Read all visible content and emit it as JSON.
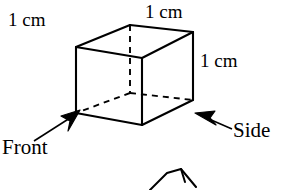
{
  "figure": {
    "background_color": "#ffffff",
    "stroke_color": "#000000",
    "labels": {
      "edge_top_left": "1 cm",
      "edge_top_right": "1 cm",
      "edge_vertical_right": "1 cm",
      "view_front": "Front",
      "view_side": "Side"
    },
    "geometry": {
      "shape": "cube",
      "visible_vertices": {
        "top_left": [
          76,
          47
        ],
        "top_back": [
          130,
          25
        ],
        "top_right": [
          193,
          32
        ],
        "top_front": [
          142,
          58
        ],
        "bottom_left": [
          76,
          113
        ],
        "bottom_front": [
          142,
          125
        ],
        "bottom_right": [
          193,
          100
        ]
      },
      "hidden_vertex": [
        130,
        93
      ],
      "hidden_edges": [
        [
          [
            130,
            25
          ],
          [
            130,
            93
          ]
        ],
        [
          [
            130,
            93
          ],
          [
            76,
            113
          ]
        ],
        [
          [
            130,
            93
          ],
          [
            193,
            100
          ]
        ]
      ]
    },
    "arrows": {
      "front_arrow": {
        "from": [
          32,
          140
        ],
        "to": [
          78,
          112
        ],
        "direction": "up-right"
      },
      "side_arrow": {
        "from": [
          232,
          128
        ],
        "to": [
          196,
          113
        ],
        "direction": "up-left"
      }
    },
    "partial_figure_below": {
      "description": "cropped second cube figure at bottom edge",
      "points": [
        [
          148,
          190
        ],
        [
          165,
          172
        ],
        [
          180,
          168
        ],
        [
          196,
          186
        ],
        [
          196,
          190
        ]
      ]
    }
  }
}
